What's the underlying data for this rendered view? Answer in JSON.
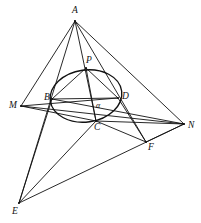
{
  "figure": {
    "type": "geometry-diagram",
    "title": "",
    "stroke_color": "#111111",
    "background_color": "#ffffff",
    "width": 201,
    "height": 223
  },
  "points": {
    "A": {
      "label": "A",
      "x": 75,
      "y": 21,
      "label_x": 72,
      "label_y": 13
    },
    "P": {
      "label": "P",
      "x": 86,
      "y": 68,
      "label_x": 86,
      "label_y": 63
    },
    "B": {
      "label": "B",
      "x": 52,
      "y": 99,
      "label_x": 44,
      "label_y": 100
    },
    "D": {
      "label": "D",
      "x": 118,
      "y": 98,
      "label_x": 122,
      "label_y": 99
    },
    "C": {
      "label": "C",
      "x": 96,
      "y": 121,
      "label_x": 94,
      "label_y": 130
    },
    "M": {
      "label": "M",
      "x": 21,
      "y": 106,
      "label_x": 9,
      "label_y": 108
    },
    "N": {
      "label": "N",
      "x": 184,
      "y": 124,
      "label_x": 188,
      "label_y": 128
    },
    "E": {
      "label": "E",
      "x": 19,
      "y": 203,
      "label_x": 12,
      "label_y": 214
    },
    "F": {
      "label": "F",
      "x": 146,
      "y": 142,
      "label_x": 148,
      "label_y": 150
    }
  },
  "angle_marks": [
    {
      "label": "α",
      "label_x": 96,
      "label_y": 108
    }
  ],
  "conic": {
    "name": "inscribed-ellipse",
    "cx": 86,
    "cy": 96,
    "rx": 36,
    "ry": 26,
    "rotation_deg": -8
  },
  "segments": [
    {
      "name": "A-M",
      "from": "A",
      "to": "M"
    },
    {
      "name": "A-E",
      "from": "A",
      "to": "E"
    },
    {
      "name": "A-C",
      "from": "A",
      "to": "C"
    },
    {
      "name": "A-N",
      "from": "A",
      "to": "N"
    },
    {
      "name": "A-F",
      "from": "A",
      "to": "F"
    },
    {
      "name": "M-D",
      "from": "M",
      "to": "D"
    },
    {
      "name": "M-N",
      "from": "M",
      "to": "N"
    },
    {
      "name": "M-C",
      "from": "M",
      "to": "C"
    },
    {
      "name": "B-D",
      "from": "B",
      "to": "D"
    },
    {
      "name": "B-N",
      "from": "B",
      "to": "N"
    },
    {
      "name": "B-E",
      "from": "B",
      "to": "E"
    },
    {
      "name": "C-E",
      "from": "C",
      "to": "E"
    },
    {
      "name": "C-N",
      "from": "C",
      "to": "N"
    },
    {
      "name": "C-F",
      "from": "C",
      "to": "F"
    },
    {
      "name": "D-F",
      "from": "D",
      "to": "F"
    },
    {
      "name": "E-N",
      "from": "E",
      "to": "N"
    },
    {
      "name": "F-N",
      "from": "F",
      "to": "N"
    },
    {
      "name": "P-C",
      "from": "P",
      "to": "C"
    },
    {
      "name": "P-B",
      "from": "P",
      "to": "B"
    },
    {
      "name": "P-D",
      "from": "P",
      "to": "D"
    }
  ]
}
